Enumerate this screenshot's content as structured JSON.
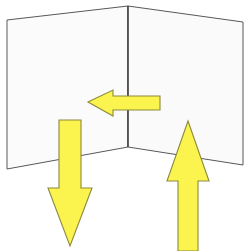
{
  "scene": {
    "title": "Two panels meeting at an inner corner with three directional arrows",
    "width": 250,
    "height": 251,
    "background_color": "#ffffff"
  },
  "colors": {
    "panel_fill": "#fbfbfc",
    "panel_outline": "#58585c",
    "corner_edge": "#3a3a3e",
    "arrow_fill": "#fbf44f",
    "arrow_outline": "#8b8a3a"
  },
  "panels": [
    {
      "id": "left-panel",
      "label": "Left panel",
      "fill": "#fbfbfc",
      "points": "7,20 128,6 128,147 7,169"
    },
    {
      "id": "right-panel",
      "label": "Right panel",
      "fill": "#fafafb",
      "points": "128,6 243,22 243,165 128,147"
    }
  ],
  "corner_edge": {
    "id": "corner-edge",
    "label": "Vertical corner seam",
    "points": "128,6 128,147"
  },
  "arrows": [
    {
      "id": "arrow-left",
      "label": "Left-pointing arrow",
      "direction": "left",
      "points": "88,102 113,90 113,96 160,96 160,110 113,110 113,116"
    },
    {
      "id": "arrow-down",
      "label": "Down-pointing arrow",
      "direction": "down",
      "points": "59,120 81,120 81,188 92,188 70,246 48,188 59,188"
    },
    {
      "id": "arrow-up",
      "label": "Up-pointing arrow",
      "direction": "up",
      "points": "188,121 209,181 198,181 198,251 178,251 178,181 167,181"
    }
  ]
}
